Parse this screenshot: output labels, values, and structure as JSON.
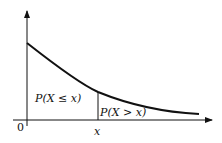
{
  "diagram": {
    "type": "probability-density-curve",
    "colors": {
      "stroke": "#111111",
      "background": "#ffffff"
    },
    "axes": {
      "origin_label": "0",
      "x_tick_label": "x"
    },
    "regions": {
      "left_label": "P(X ≤ x)",
      "right_label": "P(X > x)"
    }
  }
}
